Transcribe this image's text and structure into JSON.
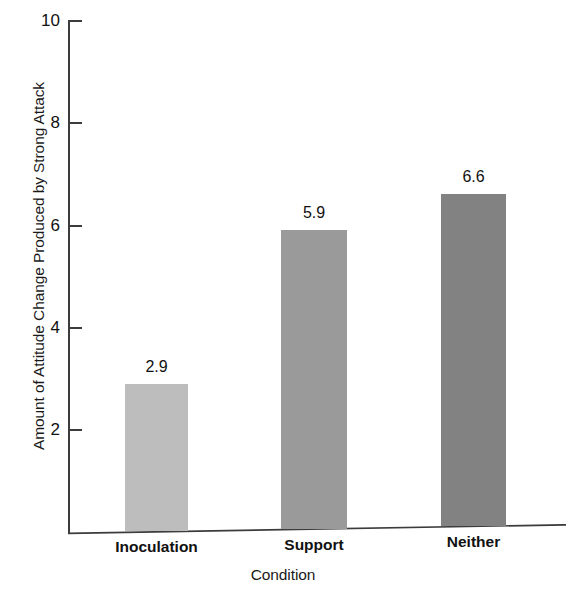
{
  "chart_data": {
    "type": "bar",
    "title": "",
    "categories": [
      "Inoculation",
      "Support",
      "Neither"
    ],
    "values": [
      2.9,
      5.9,
      6.6
    ],
    "value_labels": [
      "2.9",
      "5.9",
      "6.6"
    ],
    "xlabel": "Condition",
    "ylabel": "Amount of Attitude Change Produced by Strong Attack",
    "ylim": [
      0,
      10
    ],
    "yticks": [
      2,
      4,
      6,
      8,
      10
    ],
    "ytick_labels": [
      "2",
      "4",
      "6",
      "8",
      "10"
    ],
    "grid": false,
    "legend": "none",
    "bar_colors": [
      "#bdbdbd",
      "#9a9a9a",
      "#828282"
    ],
    "axis_color": "#3c3c3c"
  }
}
